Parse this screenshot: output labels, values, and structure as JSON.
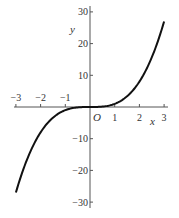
{
  "chart_data": {
    "type": "line",
    "title": "",
    "xlabel": "x",
    "ylabel": "y",
    "origin_label": "O",
    "xlim": [
      -3,
      3
    ],
    "ylim": [
      -30,
      30
    ],
    "grid": false,
    "x_ticks": [
      -3,
      -2,
      -1,
      1,
      2,
      3
    ],
    "x_tick_labels": [
      "−3",
      "−2",
      "−1",
      "1",
      "2",
      "3"
    ],
    "y_ticks": [
      -30,
      -20,
      -10,
      10,
      20,
      30
    ],
    "y_tick_labels": [
      "−30",
      "−20",
      "−10",
      "10",
      "20",
      "30"
    ],
    "series": [
      {
        "name": "y = x^3",
        "x": [
          -3,
          -2.5,
          -2,
          -1.5,
          -1,
          -0.5,
          0,
          0.5,
          1,
          1.5,
          2,
          2.5,
          3
        ],
        "y": [
          -27,
          -15.6,
          -8,
          -3.4,
          -1,
          -0.1,
          0,
          0.1,
          1,
          3.4,
          8,
          15.6,
          27
        ],
        "color": "#111111"
      }
    ]
  }
}
